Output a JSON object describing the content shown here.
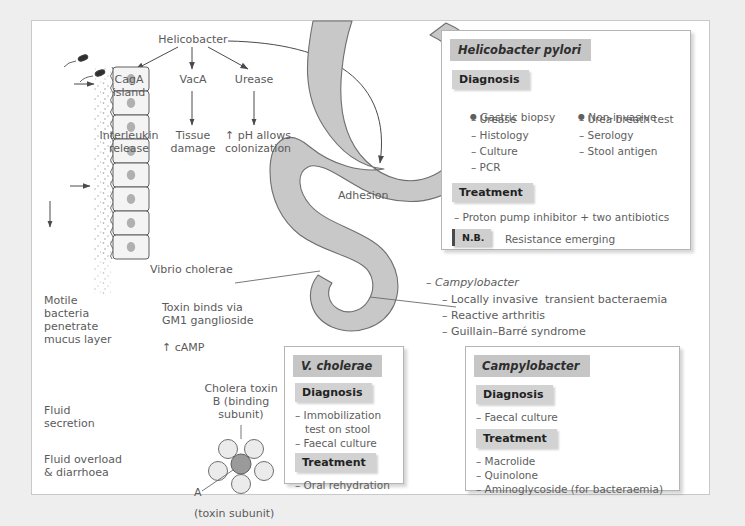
{
  "pathogenesis": {
    "root": "Helicobacter",
    "factors": [
      {
        "name": "CagA\nisland",
        "effect": "Interleukin\nrelease"
      },
      {
        "name": "VacA",
        "effect": "Tissue\ndamage"
      },
      {
        "name": "Urease",
        "effect": "↑ pH allows\ncolonization"
      }
    ],
    "adhesion_label": "Adhesion"
  },
  "hpylori_box": {
    "title": "Helicobacter pylori",
    "diagnosis_label": "Diagnosis",
    "diagnosis_col1_header": "Gastric biopsy",
    "diagnosis_col1": [
      "– Urease",
      "– Histology",
      "– Culture",
      "– PCR"
    ],
    "diagnosis_col2_header": "Non-invasive",
    "diagnosis_col2": [
      "– Urea breath test",
      "– Serology",
      "– Stool antigen"
    ],
    "treatment_label": "Treatment",
    "treatment": [
      "– Proton pump inhibitor + two antibiotics"
    ],
    "nb_badge": "N.B.",
    "nb_text": "Resistance emerging"
  },
  "cholera": {
    "organism_label": "Vibrio cholerae",
    "motile_label": "Motile\nbacteria\npenetrate\nmucus layer",
    "fluid_secretion_label": "Fluid\nsecretion",
    "fluid_overload_label": "Fluid overload\n& diarrhoea",
    "toxin_binds_label": "Toxin binds via\nGM1 ganglioside",
    "camp_label": "↑ cAMP",
    "toxin_title": "Cholera toxin\nB (binding\nsubunit)",
    "subunit_a_label": "A",
    "subunit_a_note": "(toxin subunit)"
  },
  "vcholerae_box": {
    "title": "V. cholerae",
    "diagnosis_label": "Diagnosis",
    "diagnosis": [
      "– Immobilization",
      "   test on stool",
      "– Faecal culture"
    ],
    "treatment_label": "Treatment",
    "treatment": [
      "– Oral rehydration"
    ]
  },
  "campylobacter_notes": {
    "heading": "– Campylobacter",
    "items": [
      "– Locally invasive  transient bacteraemia",
      "– Reactive arthritis",
      "– Guillain–Barré syndrome"
    ]
  },
  "campylobacter_box": {
    "title": "Campylobacter",
    "diagnosis_label": "Diagnosis",
    "diagnosis": [
      "– Faecal culture"
    ],
    "treatment_label": "Treatment",
    "treatment": [
      "– Macrolide",
      "– Quinolone",
      "– Aminoglycoside (for bacteraemia)"
    ]
  },
  "colors": {
    "organ_fill": "#c8c8c8",
    "organ_stroke": "#6f6f6f",
    "box_header": "#c6c6c6",
    "section_header": "#d2d2d2",
    "text": "#5b5b5b"
  }
}
